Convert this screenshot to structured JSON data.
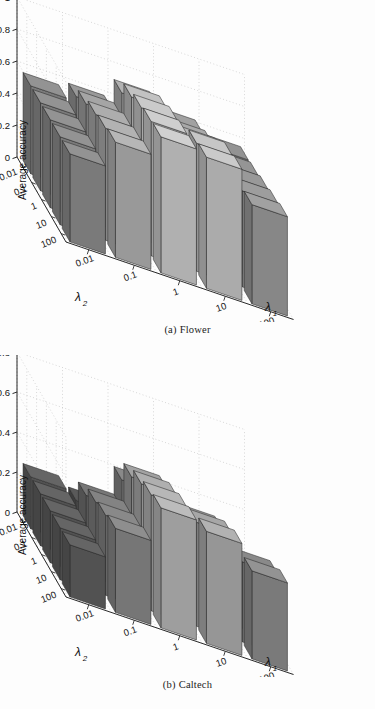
{
  "figure": {
    "panels": [
      {
        "caption_label": "(a)",
        "caption_text": "Flower",
        "ylabel": "Average accuracy",
        "xlabel": "λ",
        "xlabel_sub": "1",
        "zlabel": "λ",
        "zlabel_sub": "2",
        "yticks": [
          "0",
          "0.2",
          "0.4",
          "0.6",
          "0.8",
          "1"
        ],
        "ytickvals": [
          0,
          0.2,
          0.4,
          0.6,
          0.8,
          1
        ],
        "xticks": [
          "0.01",
          "0.1",
          "1",
          "10",
          "100"
        ],
        "zticks": [
          "0.01",
          "0.1",
          "1",
          "10",
          "100"
        ]
      },
      {
        "caption_label": "(b)",
        "caption_text": "Caltech",
        "ylabel": "Average accuracy",
        "xlabel": "λ",
        "xlabel_sub": "1",
        "zlabel": "λ",
        "zlabel_sub": "2",
        "yticks": [
          "0",
          "0.2",
          "0.4",
          "0.6",
          "0.8"
        ],
        "ytickvals": [
          0,
          0.2,
          0.4,
          0.6,
          0.8
        ],
        "xticks": [
          "0.01",
          "0.1",
          "1",
          "10",
          "100"
        ],
        "zticks": [
          "0.01",
          "0.1",
          "1",
          "10",
          "100"
        ]
      }
    ]
  },
  "chart_data": [
    {
      "type": "bar",
      "subtype": "bar3",
      "title": "(a) Flower",
      "xlabel": "lambda_1",
      "ylabel": "Average accuracy",
      "zlabel": "lambda_2",
      "x_categories": [
        "0.01",
        "0.1",
        "1",
        "10",
        "100"
      ],
      "z_categories": [
        "0.01",
        "0.1",
        "1",
        "10",
        "100"
      ],
      "ylim": [
        0,
        1
      ],
      "yticks": [
        0,
        0.2,
        0.4,
        0.6,
        0.8,
        1
      ],
      "grid": true,
      "note": "rows indexed by lambda_2 (0.01 front .. 100 back); columns indexed by lambda_1 (0.01 left .. 100 right)",
      "values": [
        [
          0.55,
          0.72,
          0.85,
          0.82,
          0.62
        ],
        [
          0.55,
          0.7,
          0.84,
          0.8,
          0.6
        ],
        [
          0.55,
          0.68,
          0.82,
          0.72,
          0.58
        ],
        [
          0.55,
          0.64,
          0.78,
          0.66,
          0.56
        ],
        [
          0.55,
          0.58,
          0.7,
          0.62,
          0.55
        ]
      ]
    },
    {
      "type": "bar",
      "subtype": "bar3",
      "title": "(b) Caltech",
      "xlabel": "lambda_1",
      "ylabel": "Average accuracy",
      "zlabel": "lambda_2",
      "x_categories": [
        "0.01",
        "0.1",
        "1",
        "10",
        "100"
      ],
      "z_categories": [
        "0.01",
        "0.1",
        "1",
        "10",
        "100"
      ],
      "ylim": [
        0,
        0.8
      ],
      "yticks": [
        0,
        0.2,
        0.4,
        0.6,
        0.8
      ],
      "grid": true,
      "note": "rows indexed by lambda_2 (0.01 front .. 100 back); columns indexed by lambda_1 (0.01 left .. 100 right)",
      "values": [
        [
          0.26,
          0.42,
          0.6,
          0.56,
          0.44
        ],
        [
          0.26,
          0.4,
          0.58,
          0.52,
          0.4
        ],
        [
          0.26,
          0.38,
          0.55,
          0.46,
          0.32
        ],
        [
          0.26,
          0.33,
          0.5,
          0.3,
          0.24
        ],
        [
          0.26,
          0.22,
          0.4,
          0.22,
          0.18
        ]
      ]
    }
  ],
  "colors": {
    "background": "#fdfdfd",
    "axis_line": "#2b2b2b",
    "grid_line": "#bdbdbd",
    "text": "#141414"
  }
}
